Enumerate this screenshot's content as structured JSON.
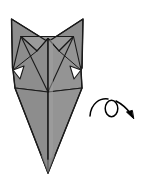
{
  "figure": {
    "title": "Origami fox head diagram with turn-over symbol",
    "caption": "",
    "background_color": "#ffffff"
  },
  "colors": {
    "paper_front": "#8d8d8d",
    "paper_back": "#9a9a9a",
    "paper_shadow": "#828282",
    "paper_highlight": "#a2a2a2",
    "outline": "#1a1a1a",
    "crease": "#1a1a1a",
    "arrow": "#000000"
  },
  "model": {
    "name": "origami-fox-model",
    "parts": [
      {
        "name": "left-ear",
        "label": "Left ear"
      },
      {
        "name": "right-ear",
        "label": "Right ear"
      },
      {
        "name": "head-top-edge",
        "label": "Head top edge"
      },
      {
        "name": "left-cheek-flap",
        "label": "Left cheek flap"
      },
      {
        "name": "right-cheek-flap",
        "label": "Right cheek flap"
      },
      {
        "name": "body-left-panel",
        "label": "Body left panel"
      },
      {
        "name": "body-right-panel",
        "label": "Body right panel"
      },
      {
        "name": "center-crease",
        "label": "Center vertical crease"
      },
      {
        "name": "snout-point",
        "label": "Bottom snout point"
      }
    ]
  },
  "symbols": {
    "turn_over": {
      "name": "turn-over-arrow",
      "label": "Turn over",
      "meaning": "Turn the model over",
      "position": {
        "x": 88,
        "y": 98,
        "width": 48,
        "height": 28
      }
    }
  },
  "geometry": {
    "left_ear_tip": {
      "x": 11,
      "y": 19
    },
    "right_ear_tip": {
      "x": 83,
      "y": 19
    },
    "head_center_peak": {
      "x": 48,
      "y": 38
    },
    "body_widest_left": {
      "x": 15,
      "y": 88
    },
    "body_widest_right": {
      "x": 82,
      "y": 88
    },
    "bottom_point": {
      "x": 48,
      "y": 173
    }
  }
}
